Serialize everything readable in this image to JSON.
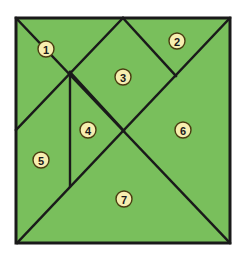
{
  "figure": {
    "name": "tangram-square-dissection",
    "background_color": "#ffffff",
    "board": {
      "fill_color": "#79bf5c",
      "stroke_color": "#1a1a1a",
      "outline_width": 3,
      "cut_line_width": 2.4,
      "x": 16,
      "y": 18,
      "width": 214,
      "height": 225
    },
    "label_style": {
      "fill_color": "#f7eeb0",
      "stroke_color": "#4a3c10",
      "text_color": "#1a1a1a",
      "radius": 8
    },
    "cut_lines": [
      {
        "name": "diagonal-top-left-to-bottom-right",
        "x1": 16,
        "y1": 18,
        "x2": 230,
        "y2": 243
      },
      {
        "name": "diagonal-top-right-to-bottom-left",
        "x1": 230,
        "y1": 18,
        "x2": 17,
        "y2": 243
      },
      {
        "name": "apex-to-left-midpoint",
        "x1": 123,
        "y1": 18,
        "x2": 16,
        "y2": 130
      },
      {
        "name": "apex-to-right-edge",
        "x1": 123,
        "y1": 18,
        "x2": 176,
        "y2": 76
      },
      {
        "name": "vertical-cut",
        "x1": 70,
        "y1": 72,
        "x2": 70,
        "y2": 186
      },
      {
        "name": "small-diagonal-cut",
        "x1": 70,
        "y1": 72,
        "x2": 124,
        "y2": 131
      }
    ],
    "pieces": [
      {
        "number": "1",
        "name": "piece-1",
        "cx": 46,
        "cy": 49
      },
      {
        "number": "2",
        "name": "piece-2",
        "cx": 177,
        "cy": 41
      },
      {
        "number": "3",
        "name": "piece-3",
        "cx": 123,
        "cy": 77
      },
      {
        "number": "4",
        "name": "piece-4",
        "cx": 88,
        "cy": 130
      },
      {
        "number": "5",
        "name": "piece-5",
        "cx": 41,
        "cy": 160
      },
      {
        "number": "6",
        "name": "piece-6",
        "cx": 183,
        "cy": 130
      },
      {
        "number": "7",
        "name": "piece-7",
        "cx": 124,
        "cy": 199
      }
    ]
  }
}
